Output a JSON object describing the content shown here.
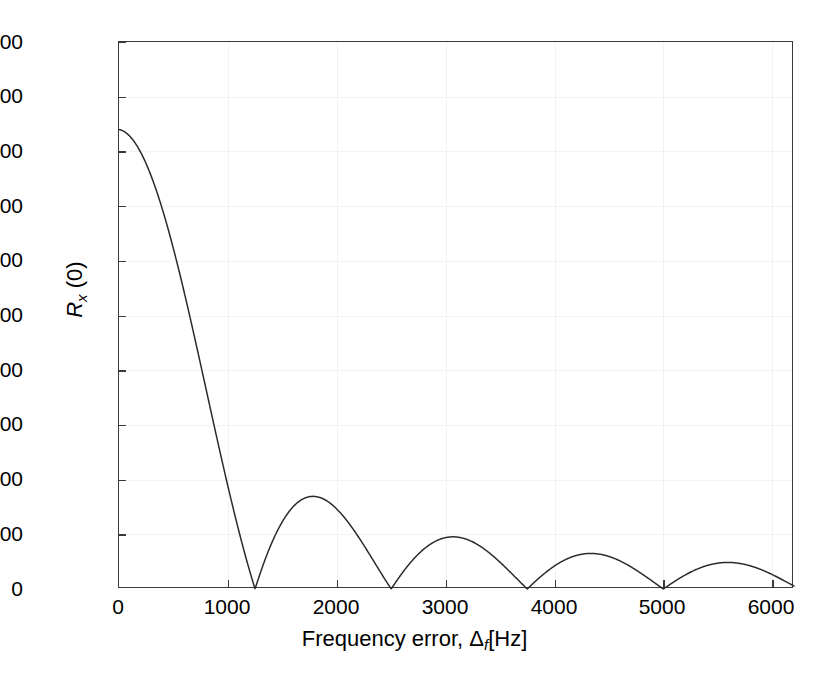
{
  "figure": {
    "background": "#ffffff",
    "frame_color": "#3a3a3a",
    "grid_color": "#f2f2f4",
    "curve_color": "#2b2b2b"
  },
  "axes": {
    "x_label_pre": "Frequency error, ",
    "x_label_delta": "Δ",
    "x_label_sub": "f",
    "x_label_post": "[Hz]",
    "y_label_main": "R",
    "y_label_sub": "x",
    "y_label_post": " (0)",
    "x_ticks": [
      "0",
      "1000",
      "2000",
      "3000",
      "4000",
      "5000",
      "6000"
    ],
    "x_tick_values": [
      0,
      1000,
      2000,
      3000,
      4000,
      5000,
      6000
    ],
    "y_ticks": [
      "0",
      "100",
      "200",
      "300",
      "400",
      "500",
      "600",
      "700",
      "800",
      "900",
      "1000"
    ],
    "y_tick_values": [
      0,
      100,
      200,
      300,
      400,
      500,
      600,
      700,
      800,
      900,
      1000
    ]
  },
  "chart_data": {
    "type": "line",
    "title": "",
    "xlabel": "Frequency error, Δ_f [Hz]",
    "ylabel": "R_x (0)",
    "xlim": [
      0,
      6200
    ],
    "ylim": [
      0,
      1000
    ],
    "grid": true,
    "legend": null,
    "series": [
      {
        "name": "R_x(0)",
        "description": "Rectified sinc-type main-lobe/side-lobe envelope of the correlation magnitude versus frequency error",
        "peak_value": 840,
        "first_null_hz": 1250,
        "null_spacing_hz": 1250,
        "nulls_hz": [
          1250,
          2500,
          3750,
          5000,
          6250
        ],
        "lobe_peaks": [
          {
            "x": 0,
            "y": 840
          },
          {
            "x": 1790,
            "y": 180
          },
          {
            "x": 3060,
            "y": 105
          },
          {
            "x": 4330,
            "y": 72
          },
          {
            "x": 5600,
            "y": 58
          }
        ],
        "x": [
          0,
          100,
          200,
          300,
          400,
          500,
          600,
          700,
          800,
          900,
          1000,
          1100,
          1200,
          1250,
          1300,
          1400,
          1500,
          1600,
          1700,
          1790,
          1900,
          2000,
          2100,
          2200,
          2300,
          2400,
          2500,
          2600,
          2700,
          2800,
          2900,
          3000,
          3060,
          3200,
          3300,
          3400,
          3500,
          3600,
          3750,
          3900,
          4000,
          4100,
          4200,
          4330,
          4500,
          4600,
          4700,
          4800,
          4900,
          5000,
          5100,
          5250,
          5400,
          5600,
          5800,
          5950,
          6100,
          6200
        ],
        "y": [
          840,
          835,
          818,
          791,
          752,
          705,
          648,
          584,
          514,
          439,
          360,
          279,
          196,
          155,
          114,
          38,
          36,
          104,
          158,
          180,
          169,
          152,
          124,
          90,
          52,
          12,
          0,
          34,
          66,
          92,
          104,
          105,
          105,
          92,
          78,
          60,
          41,
          20,
          0,
          27,
          45,
          59,
          68,
          72,
          65,
          57,
          45,
          32,
          17,
          0,
          19,
          43,
          55,
          58,
          49,
          35,
          14,
          0
        ]
      }
    ]
  }
}
